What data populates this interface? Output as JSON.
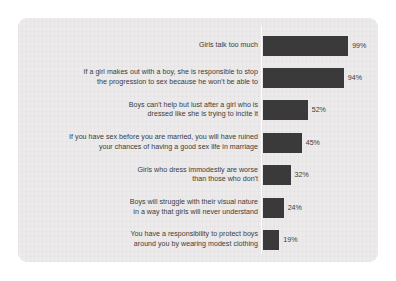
{
  "chart_data": {
    "type": "bar",
    "orientation": "horizontal",
    "title": "",
    "subtitle": "",
    "xlabel": "",
    "ylabel": "",
    "xlim": [
      0,
      100
    ],
    "grid": false,
    "legend": null,
    "value_suffix": "%",
    "categories": [
      "Girls talk too much",
      "If a girl makes out with a boy, she is responsible to stop\nthe progression to sex because he won't be able to",
      "Boys can't help but lust after a girl who is\ndressed like she is trying to incite it",
      "If you have sex before you are married, you will have ruined\nyour chances of having a good sex life in marriage",
      "Girls who dress immodestly are worse\nthan those who don't",
      "Boys will struggle with their visual nature\nin a way that girls will never understand",
      "You have a responsibility to protect boys\naround you by wearing modest clothing"
    ],
    "values": [
      99,
      94,
      52,
      45,
      32,
      24,
      19
    ],
    "data_labels": [
      "99%",
      "94%",
      "52%",
      "45%",
      "32%",
      "24%",
      "19%"
    ],
    "colors": {
      "bar": "#3a3a3a",
      "card_background": "#eceaea",
      "page_background": "#ffffff",
      "axis_line": "#ffffff",
      "text": "#3c3c3c"
    }
  }
}
